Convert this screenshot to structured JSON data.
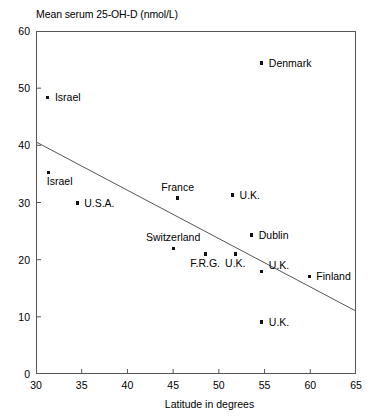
{
  "chart_data": {
    "type": "scatter",
    "title": "",
    "ylabel": "Mean serum 25-OH-D (nmol/L)",
    "xlabel": "Latitude in degrees",
    "xlim": [
      30,
      65
    ],
    "ylim": [
      0,
      60
    ],
    "xticks": [
      30,
      35,
      40,
      45,
      50,
      55,
      60,
      65
    ],
    "yticks": [
      0,
      10,
      20,
      30,
      40,
      50,
      60
    ],
    "grid": false,
    "legend": "none",
    "marker_color": "#111111",
    "line_color": "#555555",
    "points": [
      {
        "label": "Israel",
        "x": 31.3,
        "y": 48.4,
        "label_pos": "right"
      },
      {
        "label": "Israel",
        "x": 31.4,
        "y": 35.3,
        "label_pos": "below-right"
      },
      {
        "label": "U.S.A.",
        "x": 34.5,
        "y": 29.9,
        "label_pos": "right"
      },
      {
        "label": "France",
        "x": 45.5,
        "y": 30.8,
        "label_pos": "above"
      },
      {
        "label": "Switzerland",
        "x": 45.0,
        "y": 22.0,
        "label_pos": "above"
      },
      {
        "label": "F.R.G.",
        "x": 48.5,
        "y": 21.0,
        "label_pos": "below"
      },
      {
        "label": "U.K.",
        "x": 51.5,
        "y": 31.3,
        "label_pos": "right"
      },
      {
        "label": "U.K.",
        "x": 51.8,
        "y": 21.0,
        "label_pos": "below"
      },
      {
        "label": "Dublin",
        "x": 53.6,
        "y": 24.3,
        "label_pos": "right"
      },
      {
        "label": "Denmark",
        "x": 54.7,
        "y": 54.4,
        "label_pos": "right"
      },
      {
        "label": "U.K.",
        "x": 54.7,
        "y": 18.0,
        "label_pos": "above-right"
      },
      {
        "label": "U.K.",
        "x": 54.7,
        "y": 9.1,
        "label_pos": "right"
      },
      {
        "label": "Finland",
        "x": 59.9,
        "y": 17.1,
        "label_pos": "right"
      }
    ],
    "trend_line": {
      "x_start": 30,
      "y_start": 40.6,
      "x_end": 65,
      "y_end": 11.0
    }
  }
}
